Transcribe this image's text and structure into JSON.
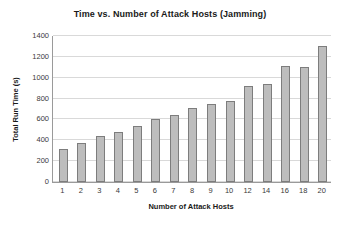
{
  "chart_data": {
    "type": "bar",
    "title": "Time vs. Number of Attack Hosts (Jamming)",
    "xlabel": "Number of Attack Hosts",
    "ylabel": "Total Run Time (s)",
    "categories": [
      "1",
      "2",
      "3",
      "4",
      "5",
      "6",
      "7",
      "8",
      "9",
      "10",
      "12",
      "14",
      "16",
      "18",
      "20"
    ],
    "values": [
      320,
      370,
      440,
      480,
      535,
      600,
      645,
      710,
      750,
      780,
      920,
      940,
      1110,
      1100,
      1300
    ],
    "series": [
      {
        "name": "Total Run Time (s)",
        "values": [
          320,
          370,
          440,
          480,
          535,
          600,
          645,
          710,
          750,
          780,
          920,
          940,
          1110,
          1100,
          1300
        ]
      }
    ],
    "ylim": [
      0,
      1400
    ],
    "yticks": [
      0,
      200,
      400,
      600,
      800,
      1000,
      1200,
      1400
    ],
    "ytick_labels": [
      "0",
      "200",
      "400",
      "600",
      "800",
      "1000",
      "1200",
      "1400"
    ],
    "grid": "horizontal",
    "legend": "none",
    "bar_color": "#bdbdbd",
    "bar_border_color": "#7d7d7d",
    "gridline_color": "#d9d9d9",
    "axis_color": "#9a9a9a",
    "text_color": "#1a1a1a",
    "background": "#ffffff"
  }
}
